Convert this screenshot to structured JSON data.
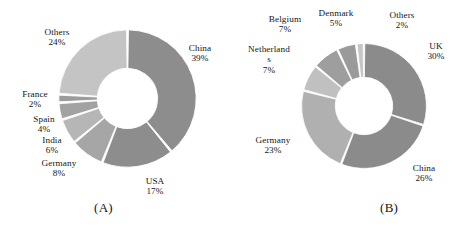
{
  "figure": {
    "background": "#ffffff",
    "panels": [
      {
        "id": "A",
        "caption": "(A)",
        "chart_data": {
          "type": "pie",
          "variant": "donut",
          "title": "",
          "xlabel": "",
          "ylabel": "",
          "start_angle_deg": 0,
          "direction": "clockwise",
          "inner_radius_ratio": 0.44,
          "legend": "none",
          "grid": false,
          "labels_show_percent": true,
          "categories": [
            "China",
            "USA",
            "Germany",
            "India",
            "Spain",
            "France",
            "Others"
          ],
          "values": [
            39,
            17,
            8,
            6,
            4,
            2,
            24
          ],
          "value_labels": [
            "39%",
            "17%",
            "8%",
            "6%",
            "4%",
            "2%",
            "24%"
          ],
          "colors": [
            "#8d8d8d",
            "#8d8d8d",
            "#a8a8a8",
            "#b4b4b4",
            "#a0a0a0",
            "#9a9a9a",
            "#c2c2c2"
          ],
          "slices": [
            {
              "name": "China",
              "value": 39,
              "value_label": "39%",
              "color": "#8d8d8d"
            },
            {
              "name": "USA",
              "value": 17,
              "value_label": "17%",
              "color": "#8d8d8d"
            },
            {
              "name": "Germany",
              "value": 8,
              "value_label": "8%",
              "color": "#a6a6a6"
            },
            {
              "name": "India",
              "value": 6,
              "value_label": "6%",
              "color": "#b6b6b6"
            },
            {
              "name": "Spain",
              "value": 4,
              "value_label": "4%",
              "color": "#a2a2a2"
            },
            {
              "name": "France",
              "value": 2,
              "value_label": "2%",
              "color": "#9c9c9c"
            },
            {
              "name": "Others",
              "value": 24,
              "value_label": "24%",
              "color": "#c4c4c4"
            }
          ]
        }
      },
      {
        "id": "B",
        "caption": "(B)",
        "chart_data": {
          "type": "pie",
          "variant": "donut",
          "title": "",
          "xlabel": "",
          "ylabel": "",
          "start_angle_deg": 0,
          "direction": "clockwise",
          "inner_radius_ratio": 0.46,
          "legend": "none",
          "grid": false,
          "labels_show_percent": true,
          "categories": [
            "UK",
            "China",
            "Germany",
            "Netherlands",
            "Belgium",
            "Denmark",
            "Others"
          ],
          "values": [
            30,
            26,
            23,
            7,
            7,
            5,
            2
          ],
          "value_labels": [
            "30%",
            "26%",
            "23%",
            "7%",
            "7%",
            "5%",
            "2%"
          ],
          "colors": [
            "#8b8b8b",
            "#8b8b8b",
            "#b0b0b0",
            "#bdbdbd",
            "#9e9e9e",
            "#9a9a9a",
            "#c6c6c6"
          ],
          "slices": [
            {
              "name": "UK",
              "value": 30,
              "value_label": "30%",
              "color": "#8b8b8b"
            },
            {
              "name": "China",
              "value": 26,
              "value_label": "26%",
              "color": "#8b8b8b"
            },
            {
              "name": "Germany",
              "value": 23,
              "value_label": "23%",
              "color": "#b0b0b0"
            },
            {
              "name": "Netherlands",
              "value": 7,
              "value_label": "7%",
              "color": "#c0c0c0"
            },
            {
              "name": "Belgium",
              "value": 7,
              "value_label": "7%",
              "color": "#9e9e9e"
            },
            {
              "name": "Denmark",
              "value": 5,
              "value_label": "5%",
              "color": "#9a9a9a"
            },
            {
              "name": "Others",
              "value": 2,
              "value_label": "2%",
              "color": "#c6c6c6"
            }
          ]
        }
      }
    ]
  },
  "panel_a": {
    "caption": "(A)",
    "labels": {
      "others": {
        "name": "Others",
        "pct": "24%"
      },
      "china": {
        "name": "China",
        "pct": "39%"
      },
      "usa": {
        "name": "USA",
        "pct": "17%"
      },
      "germany": {
        "name": "Germany",
        "pct": "8%"
      },
      "india": {
        "name": "India",
        "pct": "6%"
      },
      "spain": {
        "name": "Spain",
        "pct": "4%"
      },
      "france": {
        "name": "France",
        "pct": "2%"
      }
    }
  },
  "panel_b": {
    "caption": "(B)",
    "labels": {
      "others": {
        "name": "Others",
        "pct": "2%"
      },
      "uk": {
        "name": "UK",
        "pct": "30%"
      },
      "china": {
        "name": "China",
        "pct": "26%"
      },
      "germany": {
        "name": "Germany",
        "pct": "23%"
      },
      "netherlands": {
        "name": "Netherland",
        "name2": "s",
        "pct": "7%"
      },
      "belgium": {
        "name": "Belgium",
        "pct": "7%"
      },
      "denmark": {
        "name": "Denmark",
        "pct": "5%"
      }
    }
  }
}
